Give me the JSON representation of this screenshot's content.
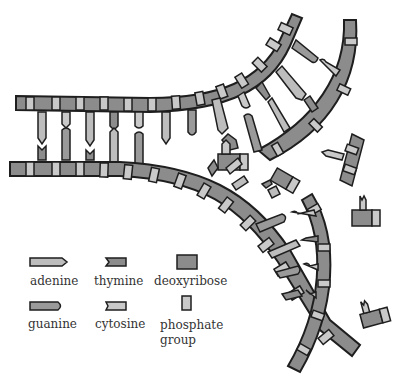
{
  "figure": {
    "colors": {
      "deoxyribose": "#8c8c8c",
      "phosphate": "#c9c9c9",
      "outline": "#1e1e1e",
      "adenine": "#bdbdbd",
      "guanine": "#9a9a9a",
      "thymine": "#8c8c8c",
      "cytosine": "#c9c9c9"
    }
  },
  "legend": {
    "items": [
      {
        "key": "adenine",
        "label": "adenine"
      },
      {
        "key": "thymine",
        "label": "thymine"
      },
      {
        "key": "deoxyribose",
        "label": "deoxyribose"
      },
      {
        "key": "guanine",
        "label": "guanine"
      },
      {
        "key": "cytosine",
        "label": "cytosine"
      },
      {
        "key": "phosphate",
        "label": "phosphate group"
      }
    ],
    "phosphate_line1": "phosphate",
    "phosphate_line2": "group"
  }
}
